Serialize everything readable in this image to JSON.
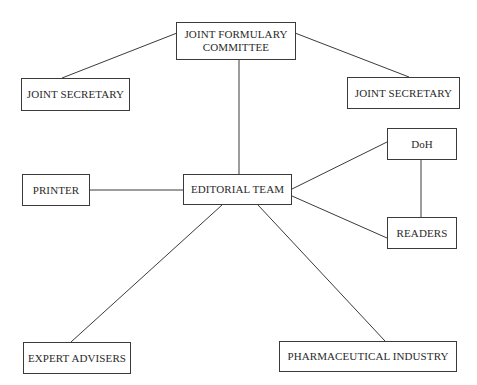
{
  "diagram": {
    "type": "organization-relationship-diagram",
    "colors": {
      "background": "#ffffff",
      "border": "#3a3a3a",
      "text": "#2a2a2a",
      "edge": "#3a3a3a"
    },
    "nodes": {
      "jfc": {
        "label": "JOINT FORMULARY\nCOMMITTEE",
        "x": 176,
        "y": 22,
        "w": 120,
        "h": 38
      },
      "js_left": {
        "label": "JOINT SECRETARY",
        "x": 21,
        "y": 78,
        "w": 109,
        "h": 33
      },
      "js_right": {
        "label": "JOINT SECRETARY",
        "x": 347,
        "y": 77,
        "w": 113,
        "h": 32
      },
      "doh": {
        "label": "DoH",
        "x": 387,
        "y": 128,
        "w": 70,
        "h": 32
      },
      "printer": {
        "label": "PRINTER",
        "x": 22,
        "y": 174,
        "w": 68,
        "h": 32
      },
      "editorial": {
        "label": "EDITORIAL TEAM",
        "x": 183,
        "y": 174,
        "w": 109,
        "h": 31
      },
      "readers": {
        "label": "READERS",
        "x": 387,
        "y": 217,
        "w": 70,
        "h": 32
      },
      "experts": {
        "label": "EXPERT ADVISERS",
        "x": 23,
        "y": 342,
        "w": 108,
        "h": 32
      },
      "pharma": {
        "label": "PHARMACEUTICAL INDUSTRY",
        "x": 279,
        "y": 341,
        "w": 178,
        "h": 31
      }
    },
    "edges": [
      {
        "from": "jfc",
        "to": "js_left",
        "x1": 177,
        "y1": 33,
        "x2": 62,
        "y2": 78
      },
      {
        "from": "jfc",
        "to": "js_right",
        "x1": 295,
        "y1": 33,
        "x2": 409,
        "y2": 77
      },
      {
        "from": "jfc",
        "to": "editorial",
        "x1": 239,
        "y1": 60,
        "x2": 239,
        "y2": 174
      },
      {
        "from": "printer",
        "to": "editorial",
        "x1": 90,
        "y1": 190,
        "x2": 183,
        "y2": 190
      },
      {
        "from": "editorial",
        "to": "doh",
        "x1": 292,
        "y1": 189,
        "x2": 387,
        "y2": 142
      },
      {
        "from": "editorial",
        "to": "readers",
        "x1": 292,
        "y1": 196,
        "x2": 387,
        "y2": 238
      },
      {
        "from": "doh",
        "to": "readers",
        "x1": 421,
        "y1": 160,
        "x2": 421,
        "y2": 217
      },
      {
        "from": "editorial",
        "to": "experts",
        "x1": 222,
        "y1": 205,
        "x2": 71,
        "y2": 342
      },
      {
        "from": "editorial",
        "to": "pharma",
        "x1": 258,
        "y1": 205,
        "x2": 385,
        "y2": 341
      }
    ]
  }
}
